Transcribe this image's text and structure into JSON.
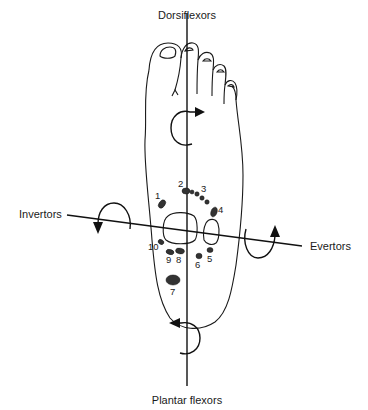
{
  "diagram": {
    "labels": {
      "top": "Dorsiflexors",
      "bottom": "Plantar flexors",
      "left": "Invertors",
      "right": "Evertors"
    },
    "points": [
      {
        "id": "1",
        "label": "1"
      },
      {
        "id": "2",
        "label": "2"
      },
      {
        "id": "3",
        "label": "3"
      },
      {
        "id": "4",
        "label": "4"
      },
      {
        "id": "5",
        "label": "5"
      },
      {
        "id": "6",
        "label": "6"
      },
      {
        "id": "7",
        "label": "7"
      },
      {
        "id": "8",
        "label": "8"
      },
      {
        "id": "9",
        "label": "9"
      },
      {
        "id": "10",
        "label": "10"
      }
    ],
    "colors": {
      "line": "#111111",
      "spot": "#333333",
      "background": "#ffffff"
    }
  }
}
